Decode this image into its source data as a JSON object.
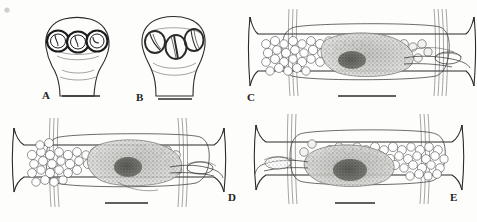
{
  "figure": {
    "background_color": "#fdfdfc",
    "ink_color": "#2b2b2b",
    "width": 477,
    "height": 222,
    "panel_count": 5
  },
  "panels": [
    {
      "id": "A",
      "label": "A",
      "label_x": 42,
      "label_y": 99,
      "type": "scolex",
      "description": "Scolex in apical-lateral view with three rounded bothridia bearing median loculus marks, tapering neck below",
      "bothridia_count": 3,
      "bothridium_shape": "rounded",
      "scalebar": {
        "x1": 62,
        "y1": 96,
        "x2": 100,
        "y2": 96
      }
    },
    {
      "id": "B",
      "label": "B",
      "label_x": 136,
      "label_y": 101,
      "type": "scolex",
      "description": "Scolex with three oval bothridia showing longitudinal median slits, neck narrowing posteriorly",
      "bothridia_count": 3,
      "bothridium_shape": "oval-with-median-slit",
      "scalebar": {
        "x1": 158,
        "y1": 99,
        "x2": 192,
        "y2": 99
      }
    },
    {
      "id": "C",
      "label": "C",
      "label_x": 247,
      "label_y": 101,
      "type": "proglottid",
      "description": "Mature proglottid, dorsal view: vitelline follicles in lateral fields, dense central ovary and testes mass, genital ducts extending to right margin",
      "scalebar": {
        "x1": 338,
        "y1": 96,
        "x2": 396,
        "y2": 96
      },
      "gonopore_side": "right"
    },
    {
      "id": "D",
      "label": "D",
      "label_x": 228,
      "label_y": 201,
      "type": "proglottid",
      "description": "Mature proglottid with vitelline follicles massed in left half, dark ovary lobes centrally, cirrus sac and vagina toward right margin",
      "scalebar": {
        "x1": 105,
        "y1": 203,
        "x2": 148,
        "y2": 203
      },
      "gonopore_side": "right"
    },
    {
      "id": "E",
      "label": "E",
      "label_x": 450,
      "label_y": 201,
      "type": "proglottid",
      "description": "Mature proglottid with vitelline follicles massed in right half, dark ovary lobes left of centre, cirrus sac and vagina toward left margin",
      "scalebar": {
        "x1": 335,
        "y1": 203,
        "x2": 375,
        "y2": 203
      },
      "gonopore_side": "left"
    }
  ],
  "legend": {
    "panel_labels": [
      "A",
      "B",
      "C",
      "D",
      "E"
    ],
    "scalebar_count": 5
  }
}
